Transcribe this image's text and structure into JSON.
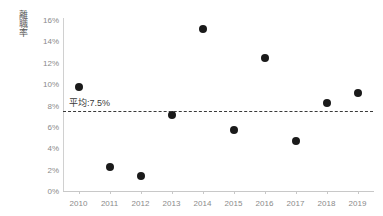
{
  "chart_data": {
    "type": "scatter",
    "title": "",
    "xlabel": "",
    "ylabel": "離職率",
    "categories": [
      "2010",
      "2011",
      "2012",
      "2013",
      "2014",
      "2015",
      "2016",
      "2017",
      "2018",
      "2019"
    ],
    "x": [
      2010,
      2011,
      2012,
      2013,
      2014,
      2015,
      2016,
      2017,
      2018,
      2019
    ],
    "values": [
      9.7,
      2.2,
      1.4,
      7.1,
      15.2,
      5.7,
      12.4,
      4.7,
      8.2,
      9.2
    ],
    "ylim": [
      0,
      16
    ],
    "ytick_values": [
      0,
      2,
      4,
      6,
      8,
      10,
      12,
      14,
      16
    ],
    "ytick_labels": [
      "0%",
      "2%",
      "4%",
      "6%",
      "8%",
      "10%",
      "12%",
      "14%",
      "16%"
    ],
    "grid": false,
    "legend": "none",
    "marker_color": "#1a1a1a",
    "axis_color": "#c8c8c8",
    "tick_label_color": "#8a8a8a",
    "annotations": [
      {
        "name": "average-line",
        "label": "平均:7.5%",
        "value": 7.5,
        "style": "dashed",
        "color": "#3a3a3a"
      }
    ]
  },
  "axis": {
    "y_caption": "離職率"
  },
  "average": {
    "label": "平均:7.5%",
    "value": 7.5
  }
}
